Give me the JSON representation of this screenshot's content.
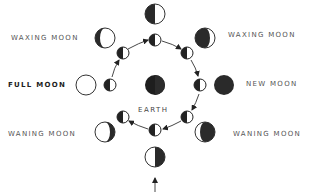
{
  "diagram": {
    "center_label": "EARTH",
    "labels": {
      "waxing_left": "WAXING MOON",
      "waxing_right": "WAXING MOON",
      "full": "FULL MOON",
      "new": "NEW MOON",
      "waning_left": "WANING MOON",
      "waning_right": "WANING MOON"
    },
    "outer_phases": [
      {
        "position": "top",
        "phase": "first-quarter-dark-left"
      },
      {
        "position": "top-right",
        "phase": "waxing-crescent-dark"
      },
      {
        "position": "right",
        "phase": "new-moon"
      },
      {
        "position": "bottom-right",
        "phase": "waning-crescent-dark"
      },
      {
        "position": "bottom",
        "phase": "half-dark-right"
      },
      {
        "position": "bottom-left",
        "phase": "gibbous-dark-crescent-right"
      },
      {
        "position": "left",
        "phase": "full-moon"
      },
      {
        "position": "top-left",
        "phase": "gibbous-dark-crescent-left"
      }
    ],
    "inner_orbit_moons": 8,
    "colors": {
      "dark": "#222222",
      "light": "#ffffff",
      "stroke": "#333333",
      "text": "#555555"
    }
  }
}
